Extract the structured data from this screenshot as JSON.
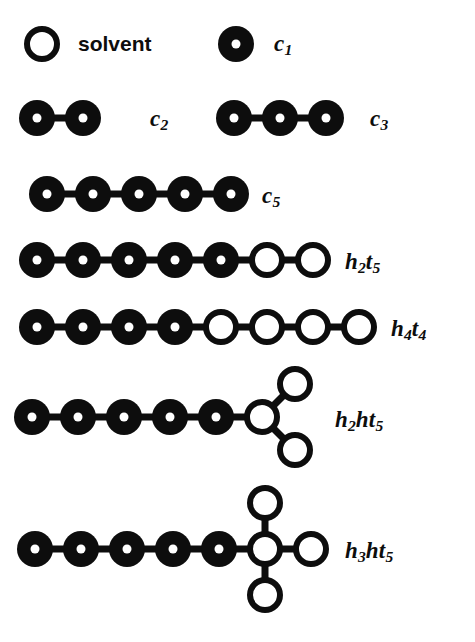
{
  "figure": {
    "background_color": "#ffffff",
    "ink_color": "#0d0d0d",
    "fill_color": "#ffffff",
    "bead_radius": 18,
    "bead_spacing": 46,
    "bond_width": 7,
    "ring_width": 6,
    "center_dot_radius": 4.5
  },
  "legend": {
    "solvent": {
      "label": "solvent",
      "bead_type": "open",
      "bead_x": 42,
      "bead_y": 44,
      "label_x": 78,
      "label_y": 33
    },
    "monomer": {
      "label": "c",
      "sub": "1",
      "bead_type": "filled",
      "bead_x": 236,
      "bead_y": 44,
      "label_x": 274,
      "label_y": 32
    }
  },
  "molecules": [
    {
      "name": "c2",
      "label": "c",
      "sub": "2",
      "label_x": 150,
      "label_y": 107,
      "chain_y": 118,
      "chain_start_x": 37,
      "beads": [
        "filled",
        "filled"
      ],
      "branches": []
    },
    {
      "name": "c3",
      "label": "c",
      "sub": "3",
      "label_x": 370,
      "label_y": 107,
      "chain_y": 118,
      "chain_start_x": 234,
      "beads": [
        "filled",
        "filled",
        "filled"
      ],
      "branches": []
    },
    {
      "name": "c5",
      "label": "c",
      "sub": "5",
      "label_x": 262,
      "label_y": 184,
      "chain_y": 194,
      "chain_start_x": 47,
      "beads": [
        "filled",
        "filled",
        "filled",
        "filled",
        "filled"
      ],
      "branches": []
    },
    {
      "name": "h2t5",
      "label": "h",
      "sub": "2",
      "label2": "t",
      "sub2": "5",
      "label_x": 345,
      "label_y": 250,
      "chain_y": 260,
      "chain_start_x": 37,
      "beads": [
        "filled",
        "filled",
        "filled",
        "filled",
        "filled",
        "open",
        "open"
      ],
      "branches": []
    },
    {
      "name": "h4t4",
      "label": "h",
      "sub": "4",
      "label2": "t",
      "sub2": "4",
      "label_x": 391,
      "label_y": 317,
      "chain_y": 327,
      "chain_start_x": 37,
      "beads": [
        "filled",
        "filled",
        "filled",
        "filled",
        "open",
        "open",
        "open",
        "open"
      ],
      "branches": []
    },
    {
      "name": "h2ht5",
      "label": "h",
      "sub": "2",
      "label2": "ht",
      "sub2": "5",
      "label_x": 335,
      "label_y": 408,
      "chain_y": 417,
      "chain_start_x": 32,
      "beads": [
        "filled",
        "filled",
        "filled",
        "filled",
        "filled",
        "open"
      ],
      "branches": [
        {
          "from_index": 5,
          "dx": 33,
          "dy": -33,
          "bead_type": "open"
        },
        {
          "from_index": 5,
          "dx": 33,
          "dy": 33,
          "bead_type": "open"
        }
      ]
    },
    {
      "name": "h3ht5",
      "label": "h",
      "sub": "3",
      "label2": "ht",
      "sub2": "5",
      "label_x": 345,
      "label_y": 539,
      "chain_y": 549,
      "chain_start_x": 35,
      "beads": [
        "filled",
        "filled",
        "filled",
        "filled",
        "filled",
        "open"
      ],
      "branches": [
        {
          "from_index": 5,
          "dx": 0,
          "dy": -46,
          "bead_type": "open"
        },
        {
          "from_index": 5,
          "dx": 46,
          "dy": 0,
          "bead_type": "open"
        },
        {
          "from_index": 5,
          "dx": 0,
          "dy": 46,
          "bead_type": "open"
        }
      ]
    }
  ]
}
